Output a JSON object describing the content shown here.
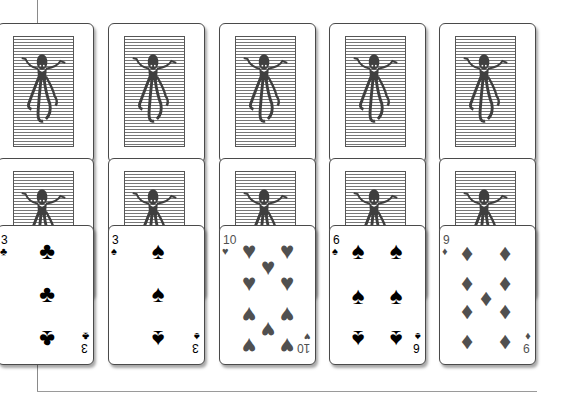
{
  "game": "solitaire-tableau",
  "colors": {
    "black_suit": "#000000",
    "red_suit_rendered": "#505050",
    "card_border": "#4a4a4a"
  },
  "back_design": "octopus-on-waves",
  "columns": [
    {
      "x": -3,
      "face_down": 2,
      "face_up": {
        "rank": "3",
        "suit": "clubs",
        "glyph": "♣",
        "color": "black",
        "pips": [
          [
            49,
            25,
            0
          ],
          [
            49,
            68,
            0
          ],
          [
            49,
            113,
            1
          ]
        ]
      }
    },
    {
      "x": 108,
      "face_down": 2,
      "face_up": {
        "rank": "3",
        "suit": "spades",
        "glyph": "♠",
        "color": "black",
        "pips": [
          [
            49,
            25,
            0
          ],
          [
            49,
            68,
            0
          ],
          [
            49,
            113,
            1
          ]
        ]
      }
    },
    {
      "x": 219,
      "face_down": 2,
      "face_up": {
        "rank": "10",
        "suit": "hearts",
        "glyph": "♥",
        "color": "gray",
        "pips": [
          [
            29,
            25,
            0
          ],
          [
            67,
            25,
            0
          ],
          [
            48,
            41,
            0
          ],
          [
            29,
            57,
            0
          ],
          [
            67,
            57,
            0
          ],
          [
            29,
            89,
            1
          ],
          [
            67,
            89,
            1
          ],
          [
            48,
            104,
            1
          ],
          [
            29,
            120,
            1
          ],
          [
            67,
            120,
            1
          ]
        ]
      }
    },
    {
      "x": 329,
      "face_down": 2,
      "face_up": {
        "rank": "6",
        "suit": "spades",
        "glyph": "♠",
        "color": "black",
        "pips": [
          [
            28,
            25,
            0
          ],
          [
            66,
            25,
            0
          ],
          [
            28,
            70,
            0
          ],
          [
            66,
            70,
            0
          ],
          [
            28,
            113,
            1
          ],
          [
            66,
            113,
            1
          ]
        ]
      }
    },
    {
      "x": 439,
      "face_down": 2,
      "face_up": {
        "rank": "9",
        "suit": "diamonds",
        "glyph": "♦",
        "color": "gray",
        "pips": [
          [
            27,
            27,
            0
          ],
          [
            65,
            27,
            0
          ],
          [
            27,
            57,
            0
          ],
          [
            65,
            57,
            0
          ],
          [
            46,
            72,
            0
          ],
          [
            27,
            87,
            1
          ],
          [
            65,
            87,
            1
          ],
          [
            27,
            117,
            1
          ],
          [
            65,
            117,
            1
          ]
        ]
      }
    }
  ],
  "layout": {
    "row_tops": [
      23,
      158
    ],
    "face_up_top": 225
  }
}
